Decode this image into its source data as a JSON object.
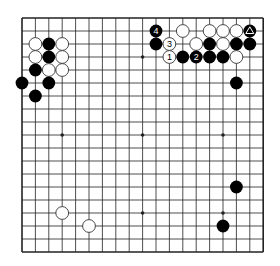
{
  "board": {
    "size": 19,
    "origin_x": 22,
    "origin_y": 18,
    "spacing_x": 13.4,
    "spacing_y": 13.0,
    "line_color": "#222222",
    "background": "#ffffff",
    "star_points": [
      [
        3,
        3
      ],
      [
        9,
        3
      ],
      [
        15,
        3
      ],
      [
        3,
        9
      ],
      [
        9,
        9
      ],
      [
        15,
        9
      ],
      [
        3,
        15
      ],
      [
        9,
        15
      ],
      [
        15,
        15
      ]
    ],
    "stone_colors": {
      "black": "#000000",
      "white": "#ffffff",
      "white_edge": "#333333"
    }
  },
  "stones": [
    {
      "col": 1,
      "row": 2,
      "color": "white"
    },
    {
      "col": 2,
      "row": 2,
      "color": "black"
    },
    {
      "col": 3,
      "row": 2,
      "color": "white"
    },
    {
      "col": 1,
      "row": 3,
      "color": "white"
    },
    {
      "col": 2,
      "row": 3,
      "color": "black"
    },
    {
      "col": 3,
      "row": 3,
      "color": "white"
    },
    {
      "col": 1,
      "row": 4,
      "color": "black"
    },
    {
      "col": 2,
      "row": 4,
      "color": "white"
    },
    {
      "col": 3,
      "row": 4,
      "color": "white"
    },
    {
      "col": 0,
      "row": 5,
      "color": "black"
    },
    {
      "col": 2,
      "row": 5,
      "color": "black"
    },
    {
      "col": 1,
      "row": 6,
      "color": "black"
    },
    {
      "col": 10,
      "row": 1,
      "color": "black",
      "label": "4"
    },
    {
      "col": 12,
      "row": 1,
      "color": "white"
    },
    {
      "col": 14,
      "row": 1,
      "color": "white"
    },
    {
      "col": 15,
      "row": 1,
      "color": "white"
    },
    {
      "col": 16,
      "row": 1,
      "color": "white"
    },
    {
      "col": 17,
      "row": 1,
      "color": "black",
      "marker": "triangle"
    },
    {
      "col": 10,
      "row": 2,
      "color": "black"
    },
    {
      "col": 11,
      "row": 2,
      "color": "white",
      "label": "3"
    },
    {
      "col": 13,
      "row": 2,
      "color": "white"
    },
    {
      "col": 14,
      "row": 2,
      "color": "black"
    },
    {
      "col": 15,
      "row": 2,
      "color": "white"
    },
    {
      "col": 16,
      "row": 2,
      "color": "black"
    },
    {
      "col": 17,
      "row": 2,
      "color": "black"
    },
    {
      "col": 11,
      "row": 3,
      "color": "white",
      "label": "1"
    },
    {
      "col": 12,
      "row": 3,
      "color": "black"
    },
    {
      "col": 13,
      "row": 3,
      "color": "black",
      "label": "2"
    },
    {
      "col": 14,
      "row": 3,
      "color": "black"
    },
    {
      "col": 15,
      "row": 3,
      "color": "black"
    },
    {
      "col": 16,
      "row": 3,
      "color": "white"
    },
    {
      "col": 16,
      "row": 5,
      "color": "black"
    },
    {
      "col": 16,
      "row": 13,
      "color": "black"
    },
    {
      "col": 15,
      "row": 16,
      "color": "black"
    },
    {
      "col": 3,
      "row": 15,
      "color": "white"
    },
    {
      "col": 5,
      "row": 16,
      "color": "white"
    }
  ]
}
